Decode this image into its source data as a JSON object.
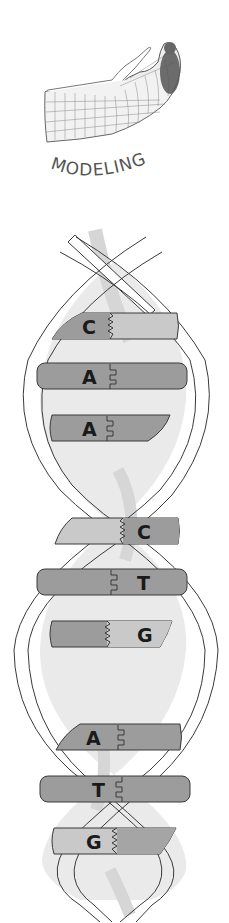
{
  "header": {
    "icon": "wireframe-hand-icon",
    "title": "MODELING"
  },
  "diagram": {
    "colors": {
      "dark_base": "#9a9a9a",
      "light_base": "#c8c8c8",
      "backbone_fill": "#ffffff",
      "backbone_stroke": "#3a3a3a",
      "interior": "#e9e9e9",
      "shadow": "#d8d8d8"
    },
    "segments": [
      {
        "pairs": [
          {
            "label": "C",
            "side": "left",
            "bond": "zigzag"
          },
          {
            "label": "A",
            "side": "left",
            "bond": "square"
          },
          {
            "label": "A",
            "side": "left",
            "bond": "square"
          }
        ]
      },
      {
        "pairs": [
          {
            "label": "C",
            "side": "right",
            "bond": "zigzag"
          },
          {
            "label": "T",
            "side": "right",
            "bond": "square"
          },
          {
            "label": "G",
            "side": "right",
            "bond": "zigzag"
          }
        ]
      },
      {
        "pairs": [
          {
            "label": "A",
            "side": "left",
            "bond": "square"
          },
          {
            "label": "T",
            "side": "left",
            "bond": "square"
          },
          {
            "label": "G",
            "side": "left",
            "bond": "zigzag"
          }
        ]
      }
    ]
  }
}
